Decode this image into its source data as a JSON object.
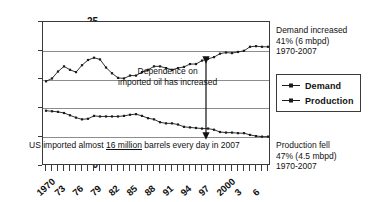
{
  "chart_data": {
    "type": "line",
    "title": "",
    "xlabel": "",
    "ylabel": "",
    "xlim": [
      1970,
      2007
    ],
    "ylim": [
      0,
      25
    ],
    "yticks": [
      0,
      5,
      10,
      15,
      20,
      25
    ],
    "xtick_labels": [
      "1970",
      "73",
      "76",
      "79",
      "82",
      "85",
      "88",
      "91",
      "94",
      "97",
      "2000",
      "3",
      "6"
    ],
    "xtick_years": [
      1970,
      1973,
      1976,
      1979,
      1982,
      1985,
      1988,
      1991,
      1994,
      1997,
      2000,
      2003,
      2006
    ],
    "grid": "horizontal",
    "legend_position": "right",
    "units": "million barrels per day",
    "x": [
      1970,
      1971,
      1972,
      1973,
      1974,
      1975,
      1976,
      1977,
      1978,
      1979,
      1980,
      1981,
      1982,
      1983,
      1984,
      1985,
      1986,
      1987,
      1988,
      1989,
      1990,
      1991,
      1992,
      1993,
      1994,
      1995,
      1996,
      1997,
      1998,
      1999,
      2000,
      2001,
      2002,
      2003,
      2004,
      2005,
      2006,
      2007
    ],
    "series": [
      {
        "name": "Demand",
        "values": [
          14.7,
          15.2,
          16.4,
          17.3,
          16.7,
          16.3,
          17.5,
          18.4,
          18.8,
          18.5,
          17.1,
          16.1,
          15.3,
          15.2,
          15.7,
          15.7,
          16.3,
          16.7,
          17.3,
          17.3,
          17.0,
          16.7,
          17.0,
          17.2,
          17.7,
          17.7,
          18.3,
          18.6,
          18.9,
          19.5,
          19.7,
          19.6,
          19.8,
          20.0,
          20.7,
          20.8,
          20.7,
          20.7
        ]
      },
      {
        "name": "Production",
        "values": [
          9.6,
          9.5,
          9.4,
          9.2,
          8.8,
          8.4,
          8.1,
          8.2,
          8.7,
          8.6,
          8.6,
          8.6,
          8.6,
          8.7,
          8.9,
          9.0,
          8.7,
          8.3,
          8.1,
          7.6,
          7.4,
          7.4,
          7.2,
          6.8,
          6.7,
          6.6,
          6.5,
          6.5,
          6.3,
          5.9,
          5.8,
          5.8,
          5.7,
          5.7,
          5.4,
          5.2,
          5.1,
          5.1
        ]
      }
    ],
    "annotations": [
      {
        "name": "dependence-note",
        "line1": "Dependence on",
        "line2": "imported oil has increased"
      },
      {
        "name": "imports-note",
        "prefix": "US imported almost ",
        "emphasis": "16 million",
        "suffix": " barrels every day in 2007"
      },
      {
        "name": "demand-increase-note",
        "line1": "Demand increased",
        "line2": "41% (6 mbpd)",
        "line3": "1970-2007"
      },
      {
        "name": "production-fall-note",
        "line1": "Production fell",
        "line2": "47% (4.5 mbpd)",
        "line3": "1970-2007"
      }
    ]
  },
  "legend": {
    "items": [
      {
        "label": "Demand",
        "color": "#1b1b1b"
      },
      {
        "label": "Production",
        "color": "#1b1b1b"
      }
    ]
  },
  "colors": {
    "demand": "#1b1b1b",
    "production": "#1b1b1b",
    "axis": "#3a3a3a",
    "grid": "#8d8d8d",
    "background": "#ffffff"
  }
}
